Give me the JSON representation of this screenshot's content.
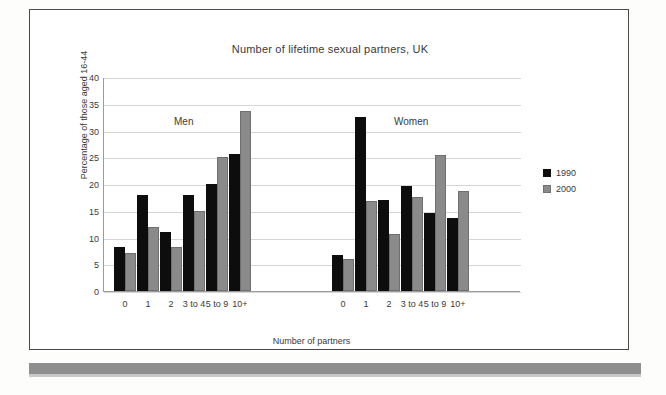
{
  "chart_data": {
    "type": "bar",
    "title": "Number of lifetime sexual partners, UK",
    "xlabel": "Number of partners",
    "ylabel": "Percentage of those aged 16-44",
    "ylim": [
      0,
      40
    ],
    "ytick_step": 5,
    "yticks": [
      "40",
      "35",
      "30",
      "25",
      "20",
      "15",
      "10",
      "5",
      "0"
    ],
    "grid": true,
    "legend_position": "right",
    "legend": [
      "1990",
      "2000"
    ],
    "panels": [
      {
        "annotation": "Men",
        "categories": [
          "0",
          "1",
          "2",
          "3 to 4",
          "5 to 9",
          "10+"
        ],
        "series": [
          {
            "name": "1990",
            "color": "#0d0d0d",
            "values": [
              8.2,
              18.0,
              11.0,
              18.0,
              20.0,
              25.6
            ]
          },
          {
            "name": "2000",
            "color": "#8a8a8a",
            "values": [
              7.1,
              12.0,
              8.2,
              15.0,
              25.0,
              33.6
            ]
          }
        ]
      },
      {
        "annotation": "Women",
        "categories": [
          "0",
          "1",
          "2",
          "3 to 4",
          "5 to 9",
          "10+"
        ],
        "series": [
          {
            "name": "1990",
            "color": "#0d0d0d",
            "values": [
              6.8,
              32.6,
              17.0,
              19.7,
              14.6,
              13.6
            ]
          },
          {
            "name": "2000",
            "color": "#8a8a8a",
            "values": [
              6.0,
              16.8,
              10.6,
              17.5,
              25.4,
              18.7
            ]
          }
        ]
      }
    ]
  }
}
